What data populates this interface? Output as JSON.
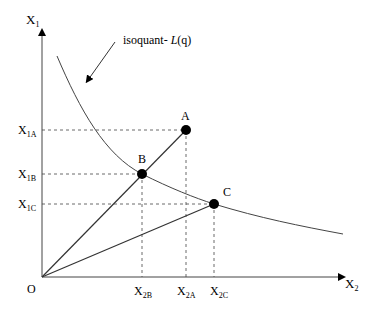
{
  "diagram": {
    "type": "isoquant",
    "axes": {
      "y_label": "X",
      "y_sub": "1",
      "x_label": "X",
      "x_sub": "2",
      "origin": "O"
    },
    "annotation": {
      "prefix": "isoquant- ",
      "italic": "L",
      "suffix": "(q)"
    },
    "points": [
      {
        "name": "A",
        "x1_label": "X",
        "x1_sub": "1A",
        "x2_label": "X",
        "x2_sub": "2A"
      },
      {
        "name": "B",
        "x1_label": "X",
        "x1_sub": "1B",
        "x2_label": "X",
        "x2_sub": "2B"
      },
      {
        "name": "C",
        "x1_label": "X",
        "x1_sub": "1C",
        "x2_label": "X",
        "x2_sub": "2C"
      }
    ],
    "colors": {
      "line": "#333333",
      "point": "#000000"
    }
  }
}
